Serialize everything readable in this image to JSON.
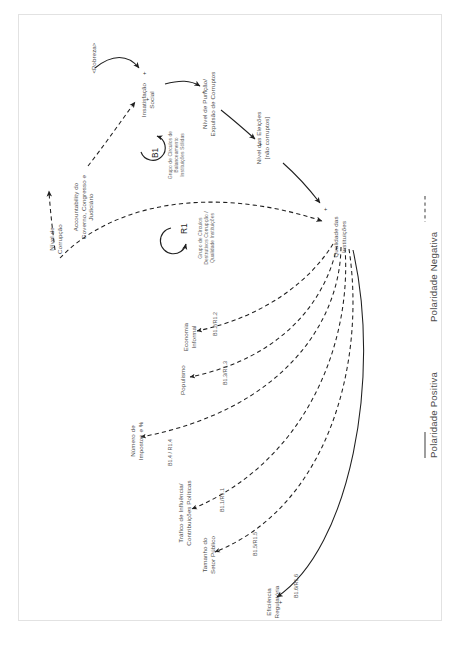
{
  "diagram": {
    "type": "causal-loop-diagram",
    "language": "pt-BR",
    "nodes": [
      {
        "id": "nivel-corrupcao",
        "label": "Nível de\nCorrupção"
      },
      {
        "id": "accountability",
        "label": "Accountability do\nGoverno, Congresso e\nJudiciário"
      },
      {
        "id": "pobreza",
        "label": "<Pobreza>"
      },
      {
        "id": "insatisfacao-social",
        "label": "Insatisfação\nSocial"
      },
      {
        "id": "nivel-punicao",
        "label": "Nível de Punição/\nExpulsão de Corruptos"
      },
      {
        "id": "nivel-eleicoes",
        "label": "Nível das Eleições\n[não corruptos]"
      },
      {
        "id": "qualidade-instituicoes",
        "label": "Qualidade das\nInstituições"
      },
      {
        "id": "economia-informal",
        "label": "Economia\nInformal"
      },
      {
        "id": "populismo",
        "label": "Populismo"
      },
      {
        "id": "numero-impostos",
        "label": "Número de\nImpostos e %"
      },
      {
        "id": "trafico-influencia",
        "label": "Tráfico de Influência/\nContribuições Políticas"
      },
      {
        "id": "tamanho-setor-publico",
        "label": "Tamanho do\nSetor Público"
      },
      {
        "id": "eficiencia-regulatoria",
        "label": "Eficiência\nRegulatória"
      }
    ],
    "loops": [
      {
        "id": "b1",
        "label": "B1",
        "description": "Grupo de Círculos de\nBalanceamento\nInstituições Sólidas"
      },
      {
        "id": "r1",
        "label": "R1",
        "description": "Grupo de Círculos\nDestrutivos Corrupção /\nQualidade Instituições"
      }
    ],
    "link_labels": [
      {
        "id": "b12r12",
        "label": "B1.2/R1.2"
      },
      {
        "id": "b13r13",
        "label": "B1.3/R1.3"
      },
      {
        "id": "b14r14",
        "label": "B1.4 / R1.4"
      },
      {
        "id": "b11r11",
        "label": "B1.1/R1.1"
      },
      {
        "id": "b15r15",
        "label": "B1.5/R1.5"
      },
      {
        "id": "b16r16",
        "label": "B1.6/R1.6"
      }
    ],
    "polarity_signs": [
      {
        "id": "sign-insatisfacao-pobreza",
        "symbol": "+"
      },
      {
        "id": "sign-insatisfacao-account",
        "symbol": "+"
      },
      {
        "id": "sign-punicao",
        "symbol": "+"
      },
      {
        "id": "sign-eleicoes",
        "symbol": "+"
      },
      {
        "id": "sign-qualidade-eleicoes",
        "symbol": "+"
      },
      {
        "id": "sign-eficiencia",
        "symbol": "+"
      }
    ],
    "legend": {
      "positive": "Polaridade Positiva",
      "negative": "Polaridade Negativa"
    },
    "colors": {
      "stroke": "#1f1f1f",
      "label": "#4d4d4d",
      "muted": "#6a6a6a",
      "frame": "#e2e2e2",
      "background": "#ffffff"
    }
  }
}
